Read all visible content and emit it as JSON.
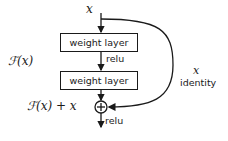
{
  "diagram": {
    "input_label": "x",
    "layers": [
      {
        "label": "weight layer"
      },
      {
        "label": "weight layer"
      }
    ],
    "activation_between": "relu",
    "activation_after_add": "relu",
    "residual_function_label": "ℱ(x)",
    "sum_label": "ℱ(x) + x",
    "skip_var_label": "x",
    "skip_label": "identity",
    "add_symbol": "+",
    "colors": {
      "stroke": "#1a1a1a",
      "background": "#ffffff"
    }
  }
}
